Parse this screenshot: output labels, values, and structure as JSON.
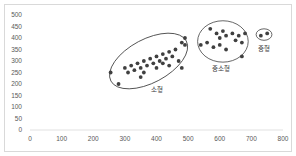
{
  "chart_data": {
    "type": "scatter",
    "title": "",
    "xlabel": "",
    "ylabel": "",
    "xlim": [
      0,
      800
    ],
    "ylim": [
      0,
      500
    ],
    "x_ticks": [
      0,
      100,
      200,
      300,
      400,
      500,
      600,
      700,
      800
    ],
    "y_ticks": [
      0,
      50,
      100,
      150,
      200,
      250,
      300,
      350,
      400,
      450,
      500
    ],
    "grid": false,
    "legend": null,
    "marker_color": "#404040",
    "groups": [
      {
        "name": "소형",
        "label_pos": [
          400,
          165
        ],
        "ellipse": {
          "cx": 375,
          "cy": 300,
          "rx": 135,
          "ry": 95,
          "rotate": -28
        },
        "points": [
          [
            255,
            250
          ],
          [
            280,
            200
          ],
          [
            300,
            270
          ],
          [
            310,
            250
          ],
          [
            320,
            280
          ],
          [
            330,
            260
          ],
          [
            340,
            290
          ],
          [
            350,
            270
          ],
          [
            350,
            230
          ],
          [
            360,
            300
          ],
          [
            360,
            250
          ],
          [
            370,
            280
          ],
          [
            380,
            310
          ],
          [
            390,
            290
          ],
          [
            400,
            270
          ],
          [
            400,
            320
          ],
          [
            410,
            300
          ],
          [
            420,
            330
          ],
          [
            420,
            290
          ],
          [
            430,
            310
          ],
          [
            440,
            340
          ],
          [
            440,
            280
          ],
          [
            450,
            320
          ],
          [
            460,
            350
          ],
          [
            470,
            300
          ],
          [
            480,
            380
          ],
          [
            480,
            270
          ],
          [
            490,
            400
          ],
          [
            490,
            370
          ]
        ]
      },
      {
        "name": "중소형",
        "label_pos": [
          605,
          255
        ],
        "ellipse": {
          "cx": 610,
          "cy": 385,
          "rx": 80,
          "ry": 90,
          "rotate": 0
        },
        "points": [
          [
            540,
            370
          ],
          [
            560,
            380
          ],
          [
            570,
            440
          ],
          [
            580,
            360
          ],
          [
            590,
            420
          ],
          [
            600,
            400
          ],
          [
            600,
            370
          ],
          [
            610,
            430
          ],
          [
            620,
            410
          ],
          [
            620,
            350
          ],
          [
            640,
            420
          ],
          [
            650,
            390
          ],
          [
            660,
            410
          ],
          [
            670,
            380
          ],
          [
            680,
            420
          ],
          [
            670,
            320
          ]
        ]
      },
      {
        "name": "중형",
        "label_pos": [
          740,
          345
        ],
        "ellipse": {
          "cx": 740,
          "cy": 415,
          "rx": 25,
          "ry": 25,
          "rotate": 0
        },
        "points": [
          [
            730,
            410
          ],
          [
            750,
            420
          ]
        ]
      }
    ]
  }
}
